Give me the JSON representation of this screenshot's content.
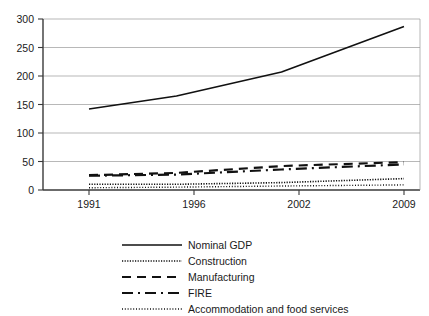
{
  "chart_data": {
    "type": "line",
    "title": "",
    "xlabel": "",
    "ylabel": "",
    "x": [
      1991,
      1996,
      2002,
      2009
    ],
    "categories": [
      "1991",
      "1996",
      "2002",
      "2009"
    ],
    "xtick_labels": [
      "1991",
      "1996",
      "2002",
      "2009"
    ],
    "ytick_labels": [
      "0",
      "50",
      "100",
      "150",
      "200",
      "250",
      "300"
    ],
    "yticks": [
      0,
      50,
      100,
      150,
      200,
      250,
      300
    ],
    "ylim": [
      0,
      300
    ],
    "xlim": [
      1991,
      2009
    ],
    "grid": "horizontal",
    "legend_position": "bottom",
    "series": [
      {
        "name": "Nominal GDP",
        "values": [
          142,
          165,
          207,
          287
        ],
        "style": "solid",
        "color": "#111111"
      },
      {
        "name": "Construction",
        "values": [
          10,
          10,
          13,
          20
        ],
        "style": "dotted",
        "color": "#111111"
      },
      {
        "name": "Manufacturing",
        "values": [
          26,
          30,
          42,
          49
        ],
        "style": "dashed",
        "color": "#111111"
      },
      {
        "name": "FIRE",
        "values": [
          25,
          27,
          36,
          45
        ],
        "style": "dashdot",
        "color": "#111111"
      },
      {
        "name": "Accommodation and food services",
        "values": [
          4,
          5,
          7,
          9
        ],
        "style": "fine-dotted",
        "color": "#111111"
      }
    ]
  },
  "legend": {
    "items": [
      {
        "label": "Nominal GDP"
      },
      {
        "label": "Construction"
      },
      {
        "label": "Manufacturing"
      },
      {
        "label": "FIRE"
      },
      {
        "label": "Accommodation and food services"
      }
    ]
  },
  "axes": {
    "y_labels": [
      "300",
      "250",
      "200",
      "150",
      "100",
      "50",
      "0"
    ],
    "x_labels": [
      "1991",
      "1996",
      "2002",
      "2009"
    ]
  },
  "colors": {
    "background": "#ffffff",
    "line": "#111111",
    "grid": "#9a9a9a",
    "axis": "#3a3a3a",
    "text": "#1a1a1a"
  }
}
